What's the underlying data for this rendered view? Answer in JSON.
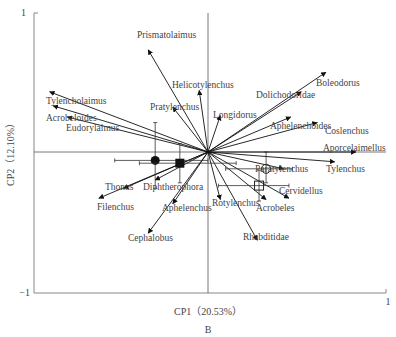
{
  "chart_data": {
    "type": "scatter",
    "subtype": "pca-biplot",
    "panel_label": "B",
    "xlabel": "CP1（20.53%）",
    "ylabel": "CP2（12.10%）",
    "xlim": [
      -1,
      1
    ],
    "ylim": [
      -1,
      1
    ],
    "x_ticks": [
      "1"
    ],
    "y_ticks": [
      "1",
      "-1"
    ],
    "grid": false,
    "reference_lines": [
      "x=0",
      "y=0"
    ],
    "vectors": [
      {
        "name": "Prismatolaimus",
        "x": -0.34,
        "y": 0.73
      },
      {
        "name": "Helicotylenchus",
        "x": -0.05,
        "y": 0.44
      },
      {
        "name": "Pratylenchus",
        "x": -0.2,
        "y": 0.32
      },
      {
        "name": "Longidorus",
        "x": 0.07,
        "y": 0.26
      },
      {
        "name": "Dolichodoridae",
        "x": 0.53,
        "y": 0.43
      },
      {
        "name": "Boleodorus",
        "x": 0.67,
        "y": 0.57
      },
      {
        "name": "Aphelenchoides",
        "x": 0.47,
        "y": 0.25
      },
      {
        "name": "Coslenchus",
        "x": 0.62,
        "y": 0.21
      },
      {
        "name": "Aporcelaimellus",
        "x": 0.84,
        "y": 0.0
      },
      {
        "name": "Tylenchus",
        "x": 0.72,
        "y": -0.07
      },
      {
        "name": "Paratylenchus",
        "x": 0.43,
        "y": -0.12
      },
      {
        "name": "Cervidellus",
        "x": 0.46,
        "y": -0.33
      },
      {
        "name": "Acrobeles",
        "x": 0.33,
        "y": -0.34
      },
      {
        "name": "Rhabditidae",
        "x": 0.28,
        "y": -0.63
      },
      {
        "name": "Rotylenchus",
        "x": 0.07,
        "y": -0.34
      },
      {
        "name": "Aphelenchus",
        "x": -0.2,
        "y": -0.37
      },
      {
        "name": "Cephalobus",
        "x": -0.34,
        "y": -0.58
      },
      {
        "name": "Diphtherophora",
        "x": -0.3,
        "y": -0.2
      },
      {
        "name": "Thonus",
        "x": -0.48,
        "y": -0.26
      },
      {
        "name": "Filenchus",
        "x": -0.62,
        "y": -0.33
      },
      {
        "name": "Tylencholaimus",
        "x": -0.9,
        "y": 0.43
      },
      {
        "name": "Acrobeloides",
        "x": -0.88,
        "y": 0.33
      },
      {
        "name": "Eudorylaimus",
        "x": -0.8,
        "y": 0.25
      }
    ],
    "points": [
      {
        "symbol": "filled-circle",
        "x": -0.3,
        "y": -0.06,
        "x_err": [
          -0.53,
          0.0
        ],
        "y_err": [
          -0.26,
          0.21
        ]
      },
      {
        "symbol": "filled-square",
        "x": -0.16,
        "y": -0.08,
        "x_err": [
          -0.39,
          0.16
        ],
        "y_err": [
          -0.22,
          0.06
        ]
      },
      {
        "symbol": "open-circle",
        "x": 0.33,
        "y": -0.12,
        "x_err": [
          0.1,
          0.48
        ],
        "y_err": [
          -0.22,
          0.0
        ]
      },
      {
        "symbol": "open-square",
        "x": 0.29,
        "y": -0.24,
        "x_err": [
          0.06,
          0.46
        ],
        "y_err": [
          -0.35,
          -0.13
        ]
      }
    ]
  }
}
